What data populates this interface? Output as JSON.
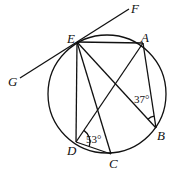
{
  "diagram": {
    "type": "geometry-circle",
    "circle": {
      "cx": 107,
      "cy": 94,
      "r": 59
    },
    "points": {
      "E": {
        "label": "E",
        "x": 77,
        "y": 42,
        "lx": 67,
        "ly": 43
      },
      "A": {
        "label": "A",
        "x": 143,
        "y": 43,
        "lx": 141,
        "ly": 42
      },
      "B": {
        "label": "B",
        "x": 156,
        "y": 128,
        "lx": 157,
        "ly": 140
      },
      "C": {
        "label": "C",
        "x": 111,
        "y": 154,
        "lx": 109,
        "ly": 168
      },
      "D": {
        "label": "D",
        "x": 76,
        "y": 142,
        "lx": 67,
        "ly": 155
      },
      "G": {
        "label": "G",
        "x": 20,
        "y": 78,
        "lx": 8,
        "ly": 86
      },
      "F": {
        "label": "F",
        "x": 129,
        "y": 9,
        "lx": 131,
        "ly": 13
      }
    },
    "segments": [
      [
        "G",
        "F"
      ],
      [
        "E",
        "A"
      ],
      [
        "E",
        "D"
      ],
      [
        "E",
        "C"
      ],
      [
        "E",
        "B"
      ],
      [
        "A",
        "D"
      ],
      [
        "A",
        "B"
      ],
      [
        "D",
        "C"
      ]
    ],
    "angles": [
      {
        "vertex": "B",
        "text": "37°",
        "x": 134,
        "y": 103
      },
      {
        "vertex": "D",
        "text": "53°",
        "x": 86,
        "y": 143
      }
    ]
  }
}
